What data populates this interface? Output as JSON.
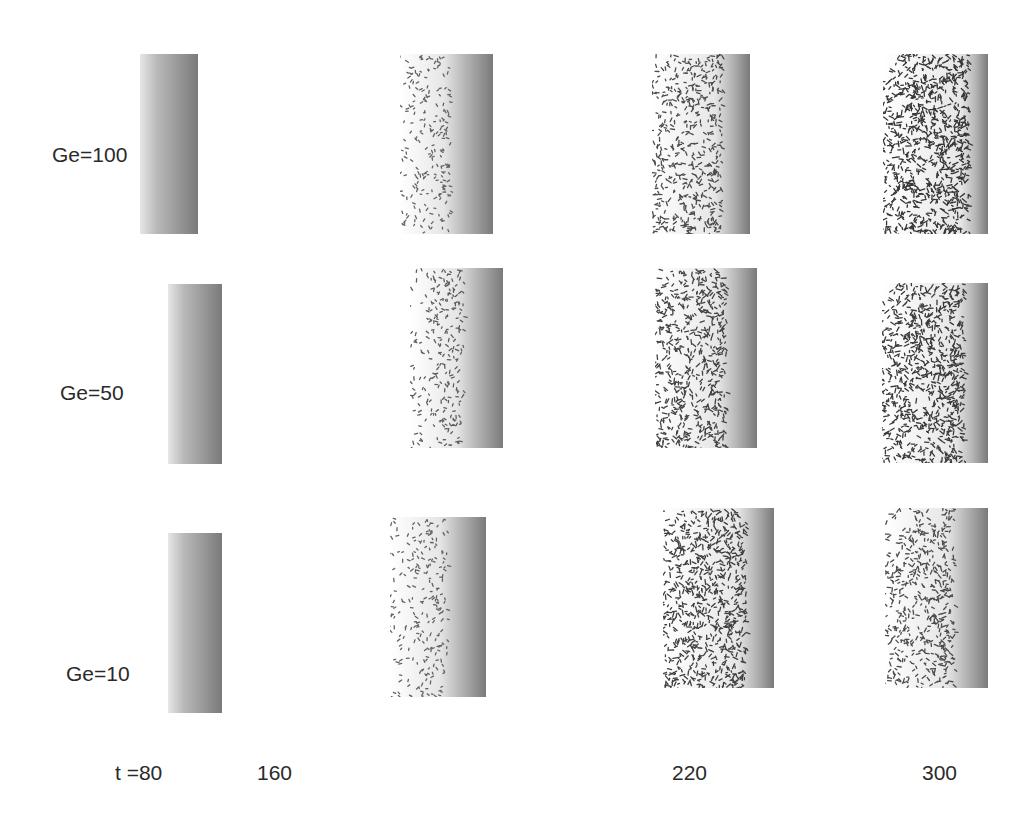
{
  "figure": {
    "row_labels": [
      "Ge=100",
      "Ge=50",
      "Ge=10"
    ],
    "column_labels": [
      "t =80",
      "160",
      "220",
      "300"
    ],
    "colors": {
      "background": "#ffffff",
      "dark_band": "#6e6e6e",
      "pattern": "#2a2a2a",
      "light": "#f2f2f2"
    }
  },
  "panels": [
    {
      "row": 0,
      "col": 0,
      "x": 140,
      "y": 54,
      "w": 58,
      "h": 180,
      "pattern_frac": 0.0,
      "density": 0.0,
      "band_frac": 1.0
    },
    {
      "row": 0,
      "col": 1,
      "x": 400,
      "y": 54,
      "w": 93,
      "h": 180,
      "pattern_frac": 0.55,
      "density": 0.35,
      "band_frac": 0.45
    },
    {
      "row": 0,
      "col": 2,
      "x": 652,
      "y": 54,
      "w": 98,
      "h": 180,
      "pattern_frac": 0.72,
      "density": 0.6,
      "band_frac": 0.28
    },
    {
      "row": 0,
      "col": 3,
      "x": 883,
      "y": 54,
      "w": 105,
      "h": 180,
      "pattern_frac": 0.82,
      "density": 0.85,
      "band_frac": 0.18
    },
    {
      "row": 1,
      "col": 0,
      "x": 168,
      "y": 284,
      "w": 54,
      "h": 180,
      "pattern_frac": 0.0,
      "density": 0.0,
      "band_frac": 1.0
    },
    {
      "row": 1,
      "col": 1,
      "x": 410,
      "y": 268,
      "w": 93,
      "h": 180,
      "pattern_frac": 0.58,
      "density": 0.4,
      "band_frac": 0.42
    },
    {
      "row": 1,
      "col": 2,
      "x": 655,
      "y": 268,
      "w": 102,
      "h": 180,
      "pattern_frac": 0.7,
      "density": 0.7,
      "band_frac": 0.3
    },
    {
      "row": 1,
      "col": 3,
      "x": 882,
      "y": 283,
      "w": 106,
      "h": 180,
      "pattern_frac": 0.78,
      "density": 0.8,
      "band_frac": 0.22
    },
    {
      "row": 2,
      "col": 0,
      "x": 168,
      "y": 533,
      "w": 54,
      "h": 180,
      "pattern_frac": 0.0,
      "density": 0.0,
      "band_frac": 1.0
    },
    {
      "row": 2,
      "col": 1,
      "x": 390,
      "y": 517,
      "w": 96,
      "h": 180,
      "pattern_frac": 0.6,
      "density": 0.35,
      "band_frac": 0.4
    },
    {
      "row": 2,
      "col": 2,
      "x": 663,
      "y": 508,
      "w": 111,
      "h": 180,
      "pattern_frac": 0.75,
      "density": 0.75,
      "band_frac": 0.25
    },
    {
      "row": 2,
      "col": 3,
      "x": 885,
      "y": 508,
      "w": 103,
      "h": 180,
      "pattern_frac": 0.68,
      "density": 0.6,
      "band_frac": 0.32
    }
  ]
}
